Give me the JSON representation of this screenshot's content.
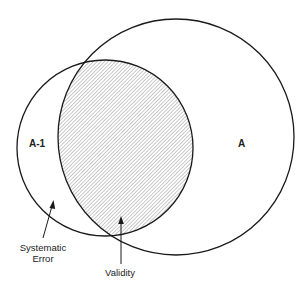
{
  "diagram": {
    "type": "venn",
    "colors": {
      "stroke": "#1a1a1a",
      "hatch": "#8a8a8a",
      "background": "#ffffff"
    },
    "sets": [
      {
        "id": "A-1",
        "label": "A-1"
      },
      {
        "id": "A",
        "label": "A"
      }
    ],
    "regions": {
      "intersection": {
        "label": "Validity",
        "fill": "hatched"
      },
      "a_minus_1_only": {
        "label_line1": "Systematic",
        "label_line2": "Error"
      }
    }
  }
}
